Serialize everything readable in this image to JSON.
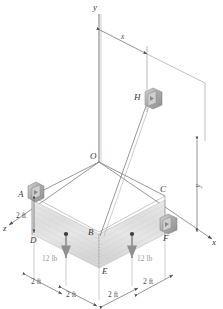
{
  "figure": {
    "type": "engineering-statics-diagram",
    "background_color": "#ffffff",
    "line_color": "#4a4a4a",
    "plate_fill": "#dcdcdc",
    "bracket_fill": "#b9b9b9",
    "force_arrow_color": "#8e8e8e",
    "dim_text_color": "#4a4a4a"
  },
  "axes": {
    "y_label": "y",
    "x_label": "x",
    "z_label": "z",
    "origin_label": "O"
  },
  "points": {
    "A": "A",
    "B": "B",
    "C": "C",
    "D": "D",
    "E": "E",
    "F": "F",
    "H": "H",
    "O": "O"
  },
  "dimensions": {
    "x_span": "x",
    "y_span": "y",
    "height_left": "2 ft",
    "bottom_left_outer": "2 ft",
    "bottom_left_inner": "2 ft",
    "bottom_right_inner": "2 ft",
    "bottom_right_outer": "2 ft"
  },
  "forces": [
    {
      "label": "12 lb",
      "side": "left"
    },
    {
      "label": "12 lb",
      "side": "right"
    }
  ],
  "supports": [
    {
      "at": "A",
      "kind": "bracket-eye-bolt"
    },
    {
      "at": "C",
      "kind": "corner"
    },
    {
      "at": "D",
      "kind": "corner"
    },
    {
      "at": "F",
      "kind": "bracket-eye-bolt"
    },
    {
      "at": "H",
      "kind": "bracket-eye-bolt"
    }
  ],
  "cables": [
    {
      "from": "H",
      "to": "B"
    },
    {
      "from": "H",
      "to": "E"
    }
  ]
}
